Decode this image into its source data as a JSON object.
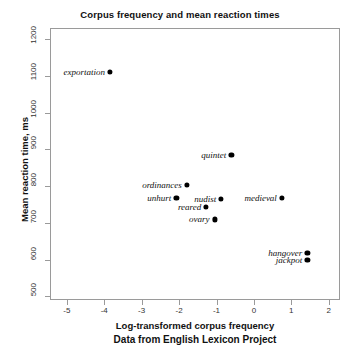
{
  "chart_data": {
    "type": "scatter",
    "title": "Corpus frequency and mean reaction times",
    "xlabel": "Log-transformed corpus frequency",
    "ylabel": "Mean reaction time, ms",
    "caption": "Data from English Lexicon Project",
    "xlim": [
      -5.45,
      2.3
    ],
    "ylim": [
      490,
      1230
    ],
    "xticks": [
      -5,
      -4,
      -3,
      -2,
      -1,
      0,
      1,
      2
    ],
    "xtick_labels": [
      "-5",
      "-4",
      "-3",
      "-2",
      "-1",
      "0",
      "1",
      "2"
    ],
    "yticks": [
      500,
      600,
      700,
      800,
      900,
      1000,
      1100,
      1200
    ],
    "ytick_labels": [
      "500",
      "600",
      "700",
      "800",
      "900",
      "1000",
      "1100",
      "1200"
    ],
    "grid": false,
    "legend": false,
    "point_color": "#000000",
    "frame_color": "#9a9a9a",
    "points": [
      {
        "label": "exportation",
        "x": -3.87,
        "y": 1113,
        "label_side": "left"
      },
      {
        "label": "quintet",
        "x": -0.63,
        "y": 887,
        "label_side": "left"
      },
      {
        "label": "ordinances",
        "x": -1.82,
        "y": 806,
        "label_side": "left"
      },
      {
        "label": "unhurt",
        "x": -2.1,
        "y": 771,
        "label_side": "left"
      },
      {
        "label": "nudist",
        "x": -0.9,
        "y": 768,
        "label_side": "left"
      },
      {
        "label": "medieval",
        "x": 0.72,
        "y": 771,
        "label_side": "left"
      },
      {
        "label": "reared",
        "x": -1.3,
        "y": 747,
        "label_side": "left"
      },
      {
        "label": "ovary",
        "x": -1.08,
        "y": 712,
        "label_side": "left"
      },
      {
        "label": "hangover",
        "x": 1.4,
        "y": 620,
        "label_side": "left"
      },
      {
        "label": "jackpot",
        "x": 1.4,
        "y": 601,
        "label_side": "left"
      }
    ]
  }
}
